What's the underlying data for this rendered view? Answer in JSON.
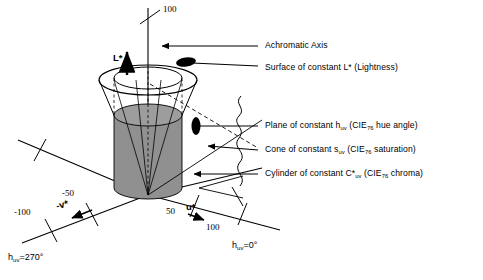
{
  "figure": {
    "type": "cie-luv-color-space-diagram",
    "background": "#ffffff",
    "ink": "#000000",
    "cylinder_fill": "#909090",
    "cylinder_top_fill": "#9d9d9d"
  },
  "callouts": [
    {
      "id": "achromatic-axis",
      "text": "Achromatic Axis"
    },
    {
      "id": "surface-lightness",
      "text": "Surface of constant L* (Lightness)"
    },
    {
      "id": "plane-hue",
      "pre": "Plane of constant h",
      "sub1": "uv",
      "mid": " (CIE",
      "sub2": "76",
      "post": " hue angle)"
    },
    {
      "id": "cone-saturation",
      "pre": "Cone of constant s",
      "sub1": "uv",
      "mid": " (CIE",
      "sub2": "76",
      "post": " saturation)"
    },
    {
      "id": "cylinder-chroma",
      "pre": "Cylinder of constant C*",
      "sub1": "uv",
      "mid": " (CIE",
      "sub2": "76",
      "post": " chroma)"
    }
  ],
  "axes": {
    "lightness": {
      "name": "L*",
      "max_tick": "100"
    },
    "u_star": {
      "name": "u*",
      "ticks": [
        "50",
        "100"
      ]
    },
    "v_star": {
      "name": "-v*",
      "ticks": [
        "-50",
        "-100"
      ]
    }
  },
  "hue_angles": {
    "zero": {
      "pre": "h",
      "sub": "uv",
      "post": "=0°"
    },
    "two_seventy": {
      "pre": "h",
      "sub": "uv",
      "post": "=270°"
    }
  }
}
